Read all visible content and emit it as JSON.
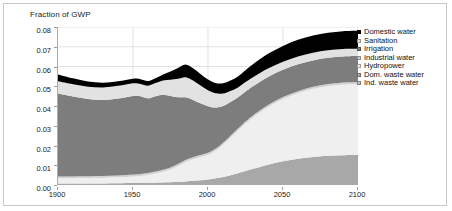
{
  "figure": {
    "axis_title": "Fraction of GWP",
    "frame_color": "#c8c8c8",
    "background": "#ffffff"
  },
  "legend": {
    "position": "right",
    "items": [
      {
        "label": "Domestic water",
        "color": "#000000"
      },
      {
        "label": "Sanitation",
        "color": "#e2e2e2"
      },
      {
        "label": "Irrigation",
        "color": "#7d7d7d"
      },
      {
        "label": "Industrial water",
        "color": "#d2d2d2"
      },
      {
        "label": "Hydropower",
        "color": "#efefef"
      },
      {
        "label": "Dom. waste water",
        "color": "#a8a8a8"
      },
      {
        "label": "Ind. waste water",
        "color": "#c4c4c4"
      }
    ]
  },
  "chart_data": {
    "type": "area",
    "stacked": true,
    "title": "",
    "xlabel": "",
    "ylabel": "Fraction of GWP",
    "xlim": [
      1900,
      2100
    ],
    "ylim": [
      0.0,
      0.08
    ],
    "grid": true,
    "xticks": [
      1900,
      1950,
      2000,
      2050,
      2100
    ],
    "xtick_labels": [
      "1900",
      "1950",
      "2000",
      "2050",
      "2100"
    ],
    "yticks": [
      0.0,
      0.01,
      0.02,
      0.03,
      0.04,
      0.05,
      0.06,
      0.07,
      0.08
    ],
    "ytick_labels": [
      "0.00",
      "0.01",
      "0.02",
      "0.03",
      "0.04",
      "0.05",
      "0.06",
      "0.07",
      "0.08"
    ],
    "x": [
      1900,
      1910,
      1920,
      1930,
      1940,
      1950,
      1955,
      1960,
      1965,
      1970,
      1975,
      1980,
      1985,
      1990,
      1995,
      2000,
      2005,
      2010,
      2015,
      2020,
      2025,
      2030,
      2040,
      2050,
      2060,
      2070,
      2080,
      2090,
      2100
    ],
    "series": [
      {
        "name": "Ind. waste water",
        "color": "#c4c4c4",
        "values": [
          0.0,
          0.0,
          0.0,
          0.0,
          0.0,
          0.0,
          0.0,
          0.0,
          0.0,
          0.0,
          0.0,
          0.0,
          0.0,
          0.0,
          0.0,
          0.0,
          0.0,
          0.0,
          0.0,
          0.0,
          0.0,
          0.0,
          0.0,
          0.0,
          0.0,
          0.0,
          0.0,
          0.0,
          0.0
        ]
      },
      {
        "name": "Dom. waste water",
        "color": "#a8a8a8",
        "values": [
          0.0008,
          0.0008,
          0.0008,
          0.0008,
          0.0009,
          0.001,
          0.001,
          0.0011,
          0.0012,
          0.0013,
          0.0014,
          0.0016,
          0.0018,
          0.0021,
          0.0024,
          0.0028,
          0.0034,
          0.0041,
          0.005,
          0.006,
          0.0071,
          0.0082,
          0.0103,
          0.012,
          0.0133,
          0.0142,
          0.0148,
          0.0151,
          0.0152
        ]
      },
      {
        "name": "Hydropower",
        "color": "#efefef",
        "values": [
          0.0026,
          0.0026,
          0.0027,
          0.0028,
          0.003,
          0.0033,
          0.0036,
          0.004,
          0.0046,
          0.0054,
          0.0065,
          0.008,
          0.0098,
          0.011,
          0.0118,
          0.0125,
          0.014,
          0.0163,
          0.019,
          0.0216,
          0.024,
          0.026,
          0.0292,
          0.0315,
          0.0332,
          0.0345,
          0.0353,
          0.0358,
          0.036
        ]
      },
      {
        "name": "Industrial water",
        "color": "#d2d2d2",
        "values": [
          0.0009,
          0.0009,
          0.0009,
          0.0009,
          0.0009,
          0.001,
          0.001,
          0.001,
          0.001,
          0.001,
          0.001,
          0.001,
          0.001,
          0.001,
          0.001,
          0.001,
          0.001,
          0.001,
          0.001,
          0.001,
          0.001,
          0.001,
          0.001,
          0.001,
          0.001,
          0.001,
          0.001,
          0.001,
          0.001
        ]
      },
      {
        "name": "Irrigation",
        "color": "#7d7d7d",
        "values": [
          0.042,
          0.0405,
          0.0392,
          0.0386,
          0.039,
          0.0398,
          0.0393,
          0.0378,
          0.0382,
          0.038,
          0.0362,
          0.0338,
          0.0318,
          0.029,
          0.0262,
          0.0236,
          0.0208,
          0.0186,
          0.017,
          0.0158,
          0.0152,
          0.0148,
          0.0142,
          0.0138,
          0.0136,
          0.0134,
          0.0133,
          0.0132,
          0.0131
        ]
      },
      {
        "name": "Sanitation",
        "color": "#e2e2e2",
        "values": [
          0.0062,
          0.0062,
          0.0062,
          0.0063,
          0.0064,
          0.0064,
          0.0062,
          0.0064,
          0.0066,
          0.0072,
          0.0082,
          0.0094,
          0.0102,
          0.0098,
          0.009,
          0.0081,
          0.0072,
          0.0063,
          0.0056,
          0.005,
          0.0048,
          0.0046,
          0.0043,
          0.0041,
          0.004,
          0.0039,
          0.0038,
          0.0038,
          0.0037
        ]
      },
      {
        "name": "Domestic water",
        "color": "#000000",
        "values": [
          0.0035,
          0.003,
          0.0026,
          0.0024,
          0.0023,
          0.0023,
          0.0025,
          0.0024,
          0.0025,
          0.0031,
          0.0042,
          0.0054,
          0.0064,
          0.0062,
          0.0058,
          0.0054,
          0.0052,
          0.0052,
          0.0053,
          0.0056,
          0.006,
          0.0065,
          0.0074,
          0.008,
          0.0084,
          0.0087,
          0.0089,
          0.009,
          0.0091
        ]
      }
    ],
    "totals_note": {
      "1900": 0.056,
      "1985": 0.073,
      "2020": 0.052,
      "2100": 0.063
    }
  }
}
